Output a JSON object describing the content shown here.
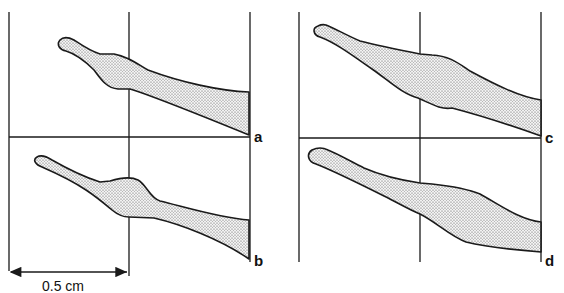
{
  "figure": {
    "panels": [
      {
        "id": "a",
        "label": "a"
      },
      {
        "id": "b",
        "label": "b"
      },
      {
        "id": "c",
        "label": "c"
      },
      {
        "id": "d",
        "label": "d"
      }
    ],
    "scale_bar": {
      "label": "0.5 cm"
    }
  },
  "colors": {
    "ink": "#1a1a1a",
    "stipple_fill": "#d9d9d9"
  }
}
